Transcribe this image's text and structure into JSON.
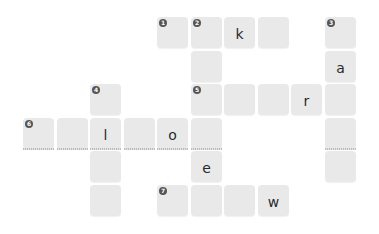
{
  "puzzle": {
    "type": "crossword",
    "colors": {
      "cell_bg": "#e9e9e9",
      "letter": "#2a2a2a",
      "number_badge": "#555555"
    },
    "cells": [
      {
        "row": 0,
        "col": 4,
        "number": "1",
        "letter": ""
      },
      {
        "row": 0,
        "col": 5,
        "number": "2",
        "letter": ""
      },
      {
        "row": 0,
        "col": 6,
        "number": "",
        "letter": "k"
      },
      {
        "row": 0,
        "col": 7,
        "number": "",
        "letter": ""
      },
      {
        "row": 0,
        "col": 9,
        "number": "3",
        "letter": ""
      },
      {
        "row": 1,
        "col": 5,
        "number": "",
        "letter": ""
      },
      {
        "row": 1,
        "col": 9,
        "number": "",
        "letter": "a"
      },
      {
        "row": 2,
        "col": 2,
        "number": "4",
        "letter": ""
      },
      {
        "row": 2,
        "col": 5,
        "number": "5",
        "letter": ""
      },
      {
        "row": 2,
        "col": 6,
        "number": "",
        "letter": ""
      },
      {
        "row": 2,
        "col": 7,
        "number": "",
        "letter": ""
      },
      {
        "row": 2,
        "col": 8,
        "number": "",
        "letter": "r"
      },
      {
        "row": 2,
        "col": 9,
        "number": "",
        "letter": ""
      },
      {
        "row": 3,
        "col": 0,
        "number": "6",
        "letter": "",
        "underline": true
      },
      {
        "row": 3,
        "col": 1,
        "number": "",
        "letter": "",
        "underline": true
      },
      {
        "row": 3,
        "col": 2,
        "number": "",
        "letter": "l",
        "underline": true
      },
      {
        "row": 3,
        "col": 3,
        "number": "",
        "letter": "",
        "underline": true
      },
      {
        "row": 3,
        "col": 4,
        "number": "",
        "letter": "o",
        "underline": true
      },
      {
        "row": 3,
        "col": 5,
        "number": "",
        "letter": "",
        "underline": true
      },
      {
        "row": 3,
        "col": 9,
        "number": "",
        "letter": "",
        "underline": true
      },
      {
        "row": 4,
        "col": 2,
        "number": "",
        "letter": ""
      },
      {
        "row": 4,
        "col": 5,
        "number": "",
        "letter": "e"
      },
      {
        "row": 4,
        "col": 9,
        "number": "",
        "letter": ""
      },
      {
        "row": 5,
        "col": 2,
        "number": "",
        "letter": ""
      },
      {
        "row": 5,
        "col": 4,
        "number": "7",
        "letter": ""
      },
      {
        "row": 5,
        "col": 5,
        "number": "",
        "letter": ""
      },
      {
        "row": 5,
        "col": 6,
        "number": "",
        "letter": ""
      },
      {
        "row": 5,
        "col": 7,
        "number": "",
        "letter": "w"
      }
    ]
  }
}
